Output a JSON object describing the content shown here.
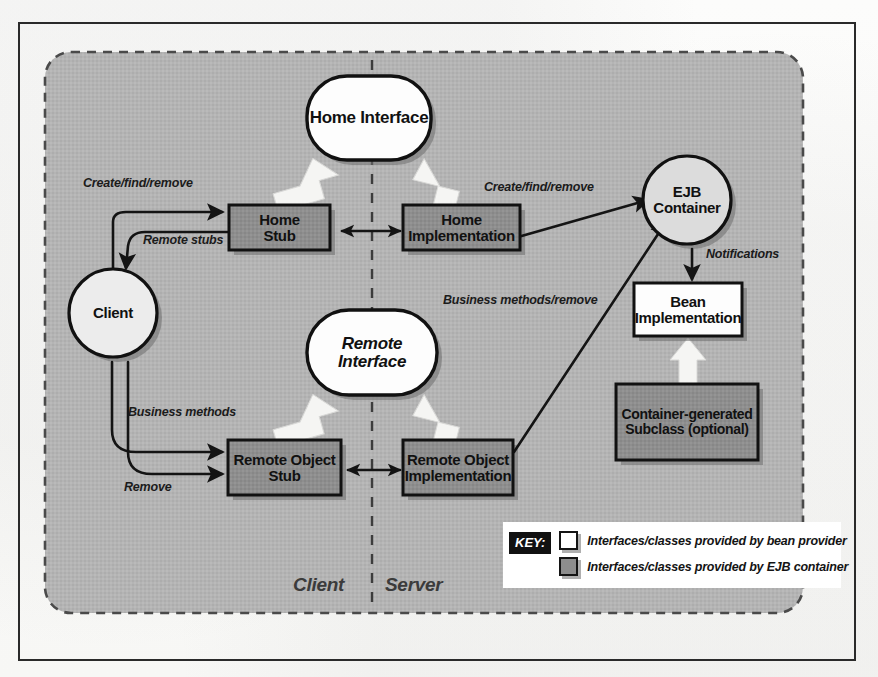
{
  "figure": {
    "zones": {
      "client_label": "Client",
      "server_label": "Server"
    },
    "colors": {
      "page_background": "#fbfbfa",
      "frame_border": "#2a2a2a",
      "region_fill": "#b3b3b3",
      "region_dash": "#4a4a4a",
      "container_box_fill": "#8d8d8d",
      "provider_box_fill": "#ffffff",
      "node_stroke": "#111111",
      "edge_stroke": "#141414",
      "white_arrow_fill": "#f4f4f4",
      "shadow": "#6e6e6e",
      "key_tag_bg": "#111111",
      "key_tag_text": "#ffffff"
    }
  },
  "nodes": {
    "home_interface": {
      "label": "Home Interface",
      "shape": "rounded-oval",
      "fill": "provider"
    },
    "remote_interface": {
      "label": "Remote Interface",
      "shape": "rounded-oval",
      "fill": "provider"
    },
    "client": {
      "label": "Client",
      "shape": "circle",
      "fill": "provider"
    },
    "ejb_container": {
      "label": "EJB\nContainer",
      "shape": "circle",
      "fill": "provider"
    },
    "home_stub": {
      "label": "Home\nStub",
      "shape": "rect",
      "fill": "container"
    },
    "home_implementation": {
      "label": "Home\nImplementation",
      "shape": "rect",
      "fill": "container"
    },
    "remote_object_stub": {
      "label": "Remote Object\nStub",
      "shape": "rect",
      "fill": "container"
    },
    "remote_object_implementation": {
      "label": "Remote Object\nImplementation",
      "shape": "rect",
      "fill": "container"
    },
    "bean_implementation": {
      "label": "Bean\nImplementation",
      "shape": "rect",
      "fill": "provider"
    },
    "container_generated_subclass": {
      "label": "Container-generated\nSubclass (optional)",
      "shape": "rect",
      "fill": "container"
    }
  },
  "edges": [
    {
      "id": "client-to-home-stub",
      "label": "Create/find/remove",
      "from": "client",
      "to": "home_stub"
    },
    {
      "id": "home-stub-to-client",
      "label": "Remote stubs",
      "from": "home_stub",
      "to": "client"
    },
    {
      "id": "home-impl-to-container",
      "label": "Create/find/remove",
      "from": "home_implementation",
      "to": "ejb_container"
    },
    {
      "id": "container-to-bean",
      "label": "Notifications",
      "from": "ejb_container",
      "to": "bean_implementation"
    },
    {
      "id": "remote-impl-to-container",
      "label": "Business methods/remove",
      "from": "remote_object_implementation",
      "to": "ejb_container"
    },
    {
      "id": "client-to-remote-stub",
      "label": "Business methods",
      "from": "client",
      "to": "remote_object_stub"
    },
    {
      "id": "client-to-remote-stub-remove",
      "label": "Remove",
      "from": "client",
      "to": "remote_object_stub"
    },
    {
      "id": "home-stub-home-impl",
      "label": "",
      "from": "home_stub",
      "to": "home_implementation"
    },
    {
      "id": "remote-stub-remote-impl",
      "label": "",
      "from": "remote_object_stub",
      "to": "remote_object_implementation"
    }
  ],
  "key": {
    "tag": "KEY:",
    "items": [
      {
        "swatch": "light",
        "text": "Interfaces/classes provided by bean provider"
      },
      {
        "swatch": "dark",
        "text": "Interfaces/classes provided by EJB container"
      }
    ]
  }
}
